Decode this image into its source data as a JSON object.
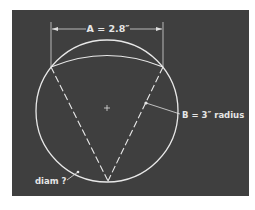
{
  "diagram": {
    "colors": {
      "background": "#ffffff",
      "panel": "#3f3f3f",
      "stroke": "#e8e8e8"
    },
    "labels": {
      "dimension_a": "A = 2.8″",
      "radius_b": "B = 3″ radius",
      "diameter": "diam ?"
    },
    "shapes": {
      "circle": {
        "cx": 107,
        "cy": 111,
        "r": 71
      },
      "chord_endpoints": [
        [
          51,
          67
        ],
        [
          163,
          67
        ]
      ],
      "inner_arc_peak_y": 55,
      "v_apex": [
        108,
        181
      ],
      "center_mark": [
        107,
        108
      ]
    }
  }
}
